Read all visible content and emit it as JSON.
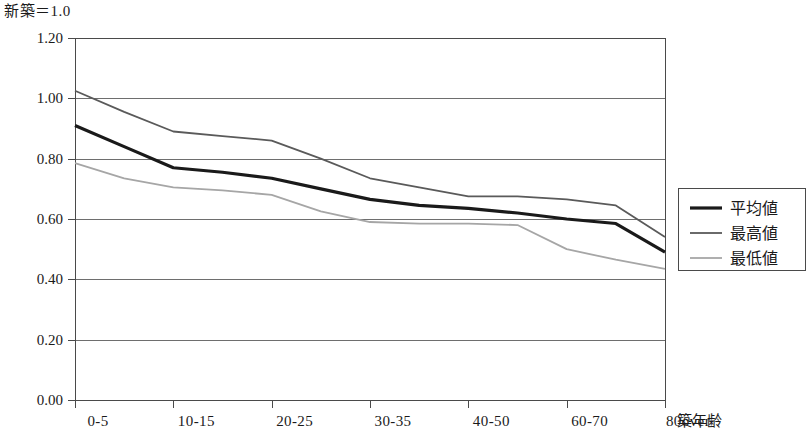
{
  "unit_note": "新築＝1.0",
  "chart_data": {
    "type": "line",
    "title": "",
    "subtitle": "",
    "unit_note": "新築＝1.0",
    "xlabel": "築年齢",
    "ylabel": "",
    "categories": [
      "0-5",
      "5-10",
      "10-15",
      "15-20",
      "20-25",
      "25-30",
      "30-35",
      "35-40",
      "40-50",
      "50-60",
      "60-70",
      "70-80",
      "80over"
    ],
    "tick_labels": [
      "0-5",
      "10-15",
      "20-25",
      "30-35",
      "40-50",
      "60-70",
      "80over"
    ],
    "ylim": [
      0.0,
      1.2
    ],
    "yticks": [
      "0.00",
      "0.20",
      "0.40",
      "0.60",
      "0.80",
      "1.00",
      "1.20"
    ],
    "ytick_values": [
      0.0,
      0.2,
      0.4,
      0.6,
      0.8,
      1.0,
      1.2
    ],
    "grid": true,
    "legend_position": "right",
    "series": [
      {
        "name": "平均値",
        "color": "#1a1a1a",
        "width": 3.2,
        "values": [
          0.91,
          0.84,
          0.77,
          0.755,
          0.735,
          0.7,
          0.665,
          0.645,
          0.635,
          0.62,
          0.6,
          0.585,
          0.49
        ]
      },
      {
        "name": "最高値",
        "color": "#5a5a5a",
        "width": 1.8,
        "values": [
          1.025,
          0.955,
          0.89,
          0.875,
          0.86,
          0.8,
          0.735,
          0.705,
          0.675,
          0.675,
          0.665,
          0.645,
          0.54
        ]
      },
      {
        "name": "最低値",
        "color": "#a6a6a6",
        "width": 1.8,
        "values": [
          0.785,
          0.735,
          0.705,
          0.695,
          0.68,
          0.625,
          0.59,
          0.585,
          0.585,
          0.58,
          0.5,
          0.465,
          0.435
        ]
      }
    ]
  },
  "legend": {
    "entries": [
      {
        "label": "平均値"
      },
      {
        "label": "最高値"
      },
      {
        "label": "最低値"
      }
    ]
  }
}
